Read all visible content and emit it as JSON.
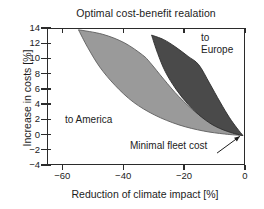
{
  "chart_data": {
    "type": "area",
    "title": "Optimal cost-benefit realation",
    "xlabel": "Reduction of climate impact [%]",
    "ylabel": "Increase in costs [%]",
    "xlim": [
      -65,
      0
    ],
    "ylim": [
      -4,
      14
    ],
    "xticks": [
      -60,
      -40,
      -20,
      0
    ],
    "xtick_labels": [
      "−60",
      "−40",
      "−20",
      "0"
    ],
    "yticks": [
      -4,
      -2,
      0,
      2,
      4,
      6,
      8,
      10,
      12,
      14
    ],
    "ytick_labels": [
      "−4",
      "−2",
      "0",
      "2",
      "4",
      "6",
      "8",
      "10",
      "12",
      "14"
    ],
    "grid": false,
    "legend_position": "in-plot annotations",
    "series": [
      {
        "name": "to America",
        "color": "#9a9a9a",
        "label": "to America",
        "upper_bound": [
          {
            "x": -55.0,
            "y": 13.9
          },
          {
            "x": -47.0,
            "y": 13.3
          },
          {
            "x": -40.0,
            "y": 12.2
          },
          {
            "x": -34.0,
            "y": 10.6
          },
          {
            "x": -31.5,
            "y": 9.6
          },
          {
            "x": -27.0,
            "y": 7.4
          },
          {
            "x": -22.0,
            "y": 5.1
          },
          {
            "x": -16.0,
            "y": 2.9
          },
          {
            "x": -10.0,
            "y": 1.4
          },
          {
            "x": -5.0,
            "y": 0.5
          },
          {
            "x": -1.0,
            "y": 0.0
          }
        ],
        "lower_bound": [
          {
            "x": -55.0,
            "y": 13.9
          },
          {
            "x": -52.0,
            "y": 11.6
          },
          {
            "x": -48.0,
            "y": 9.0
          },
          {
            "x": -43.0,
            "y": 6.6
          },
          {
            "x": -37.0,
            "y": 4.4
          },
          {
            "x": -30.0,
            "y": 2.7
          },
          {
            "x": -22.0,
            "y": 1.4
          },
          {
            "x": -14.0,
            "y": 0.6
          },
          {
            "x": -7.0,
            "y": 0.2
          },
          {
            "x": -1.0,
            "y": 0.0
          }
        ]
      },
      {
        "name": "to Europe",
        "color": "#4a4a4a",
        "label": "to Europe",
        "upper_bound": [
          {
            "x": -31.0,
            "y": 13.2
          },
          {
            "x": -27.0,
            "y": 12.6
          },
          {
            "x": -23.0,
            "y": 11.6
          },
          {
            "x": -19.0,
            "y": 10.4
          },
          {
            "x": -15.5,
            "y": 9.3
          },
          {
            "x": -12.0,
            "y": 6.9
          },
          {
            "x": -8.5,
            "y": 4.4
          },
          {
            "x": -5.5,
            "y": 2.4
          },
          {
            "x": -3.0,
            "y": 1.0
          },
          {
            "x": -1.0,
            "y": 0.0
          }
        ],
        "lower_bound": [
          {
            "x": -31.0,
            "y": 13.2
          },
          {
            "x": -29.0,
            "y": 10.8
          },
          {
            "x": -26.5,
            "y": 8.4
          },
          {
            "x": -23.0,
            "y": 6.1
          },
          {
            "x": -19.0,
            "y": 4.1
          },
          {
            "x": -14.5,
            "y": 2.4
          },
          {
            "x": -10.0,
            "y": 1.2
          },
          {
            "x": -5.0,
            "y": 0.4
          },
          {
            "x": -1.0,
            "y": 0.0
          }
        ]
      }
    ],
    "annotations": [
      {
        "name": "to-america",
        "text": "to America",
        "x": -49,
        "y": 2.6
      },
      {
        "name": "to-europe",
        "text": "to\nEurope",
        "x": -13,
        "y": 13.0
      },
      {
        "name": "minimal-fleet-cost",
        "text": "Minimal fleet cost",
        "x": -28,
        "y": -1.5,
        "arrow": {
          "from_x": -9.5,
          "from_y": -2.3,
          "to_x": -2.0,
          "to_y": -0.1
        }
      }
    ]
  },
  "labels": {
    "title": "Optimal cost-benefit realation",
    "xaxis": "Reduction of climate impact [%]",
    "yaxis": "Increase in costs [%]",
    "annot_america": "to America",
    "annot_europe_line1": "to",
    "annot_europe_line2": "Europe",
    "annot_minimal": "Minimal fleet cost"
  },
  "colors": {
    "america_fill": "#9a9a9a",
    "europe_fill": "#4a4a4a",
    "axis": "#2b2b2b",
    "background": "#ffffff",
    "text": "#1c1c1c"
  }
}
